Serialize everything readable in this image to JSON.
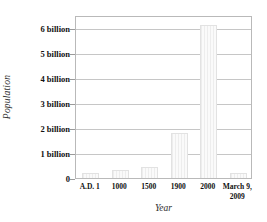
{
  "chart_data": {
    "type": "bar",
    "title": "",
    "xlabel": "Year",
    "ylabel": "Population",
    "categories": [
      "A.D. 1",
      "1000",
      "1500",
      "1900",
      "2000",
      "March 9, 2009"
    ],
    "values": [
      200000000,
      310000000,
      425000000,
      1800000000,
      6100000000,
      200000000
    ],
    "ylim": [
      0,
      6500000000
    ],
    "grid": true,
    "legend": null,
    "y_ticks": [
      0,
      1000000000,
      2000000000,
      3000000000,
      4000000000,
      5000000000,
      6000000000
    ],
    "y_tick_labels": [
      "0",
      "1 billion",
      "2 billion",
      "3 billion",
      "4 billion",
      "5 billion",
      "6 billion"
    ],
    "bar_color": "#f2f2f2",
    "grid_color": "#c6c6c6",
    "frame_color": "#b9b9b9",
    "text_color": "#111111"
  },
  "axes": {
    "y_title": "Population",
    "x_title": "Year"
  },
  "x_categories": [
    {
      "label": "A.D. 1",
      "line1": "A.D. 1",
      "line2": ""
    },
    {
      "label": "1000",
      "line1": "1000",
      "line2": ""
    },
    {
      "label": "1500",
      "line1": "1500",
      "line2": ""
    },
    {
      "label": "1900",
      "line1": "1900",
      "line2": ""
    },
    {
      "label": "2000",
      "line1": "2000",
      "line2": ""
    },
    {
      "label": "March 9, 2009",
      "line1": "March 9,",
      "line2": "2009"
    }
  ]
}
